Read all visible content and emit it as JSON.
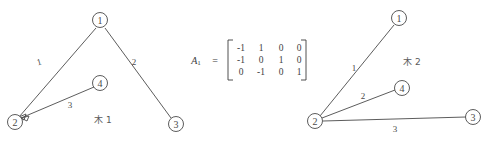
{
  "figure": {
    "background_color": "#ffffff",
    "ink_color": "#4a4a4a"
  },
  "tree_left": {
    "caption": "木 1",
    "caption_x": 103,
    "caption_y": 120,
    "nodes": [
      {
        "label": "1",
        "x": 100,
        "y": 20
      },
      {
        "label": "2",
        "x": 15,
        "y": 122
      },
      {
        "label": "3",
        "x": 176,
        "y": 124
      },
      {
        "label": "4",
        "x": 100,
        "y": 83
      }
    ],
    "edges": [
      {
        "label": "1",
        "from": 0,
        "to": 1,
        "label_x": 39,
        "label_y": 62,
        "arrow": true
      },
      {
        "label": "2",
        "from": 0,
        "to": 2,
        "label_x": 134,
        "label_y": 62,
        "arrow": false
      },
      {
        "label": "3",
        "from": 3,
        "to": 1,
        "label_x": 70,
        "label_y": 105,
        "arrow": true
      }
    ]
  },
  "matrix": {
    "name": "A",
    "subscript": "1",
    "equals": "=",
    "name_x": 196,
    "name_y": 60,
    "equals_x": 215,
    "equals_y": 60,
    "rows": [
      [
        "-1",
        "1",
        "0",
        "0"
      ],
      [
        "-1",
        "0",
        "1",
        "0"
      ],
      [
        "0",
        "-1",
        "0",
        "1"
      ]
    ],
    "left_bracket_x": 228,
    "right_bracket_x": 306,
    "bracket_top": 40,
    "bracket_bottom": 80,
    "col_x": [
      241,
      261,
      281,
      299
    ],
    "row_y": [
      48,
      60,
      72
    ]
  },
  "tree_right": {
    "caption": "木 2",
    "caption_x": 412,
    "caption_y": 62,
    "nodes": [
      {
        "label": "1",
        "x": 399,
        "y": 18
      },
      {
        "label": "2",
        "x": 315,
        "y": 121
      },
      {
        "label": "3",
        "x": 473,
        "y": 117
      },
      {
        "label": "4",
        "x": 402,
        "y": 88
      }
    ],
    "edges": [
      {
        "label": "1",
        "from": 1,
        "to": 0,
        "label_x": 354,
        "label_y": 68,
        "arrow": false
      },
      {
        "label": "2",
        "from": 1,
        "to": 3,
        "label_x": 363,
        "label_y": 96,
        "arrow": false
      },
      {
        "label": "3",
        "from": 1,
        "to": 2,
        "label_x": 395,
        "label_y": 129,
        "arrow": false
      }
    ]
  }
}
